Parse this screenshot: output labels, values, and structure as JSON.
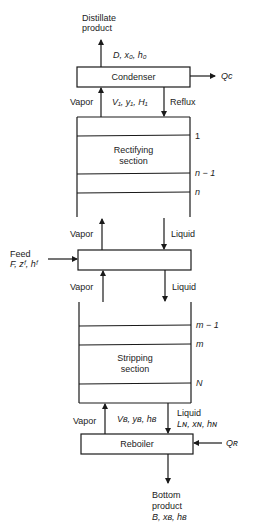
{
  "diagram": {
    "distillate": {
      "line1": "Distillate",
      "line2": "product",
      "vars": "D, x₀, h₀"
    },
    "condenser": {
      "label": "Condenser",
      "heat": "Qᴄ"
    },
    "top_streams": {
      "vapor": "Vapor",
      "vapor_vars": "V₁, y₁, H₁",
      "reflux": "Reflux"
    },
    "rectifying": {
      "line1": "Rectifying",
      "line2": "section",
      "stages": [
        "1",
        "n − 1",
        "n"
      ]
    },
    "feed_zone": {
      "vapor_above": "Vapor",
      "liquid_above": "Liquid",
      "vapor_below": "Vapor",
      "liquid_below": "Liquid"
    },
    "feed": {
      "line1": "Feed",
      "vars": "F, zᶠ, hᶠ"
    },
    "stripping": {
      "line1": "Stripping",
      "line2": "section",
      "stages": [
        "m − 1",
        "m",
        "N"
      ]
    },
    "bottom_streams": {
      "vapor": "Vapor",
      "vapor_vars": "Vʙ, yʙ, hʙ",
      "liquid": "Liquid",
      "liquid_vars": "Lɴ, xɴ, hɴ"
    },
    "reboiler": {
      "label": "Reboiler",
      "heat": "Qʀ"
    },
    "bottoms": {
      "line1": "Bottom",
      "line2": "product",
      "vars": "B, xʙ, hʙ"
    }
  },
  "colors": {
    "stroke": "#1a1a1a",
    "background": "#ffffff"
  }
}
